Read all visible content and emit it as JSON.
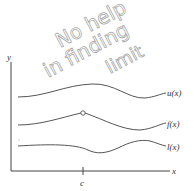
{
  "figure": {
    "axes": {
      "y_label": "y",
      "x_label": "x",
      "tick_label": "c"
    },
    "curves": [
      {
        "id": "upper",
        "label": "u(x)"
      },
      {
        "id": "middle",
        "label": "f(x)"
      },
      {
        "id": "lower",
        "label": "l(x)"
      }
    ],
    "open_point": {
      "on": "f(x)",
      "at": "c"
    },
    "annotation": {
      "line1": "No help",
      "line2": "in finding",
      "line3": "limit"
    },
    "colors": {
      "curve": "#555555",
      "axis": "#444444",
      "annotation": "#9a9a9a"
    }
  }
}
